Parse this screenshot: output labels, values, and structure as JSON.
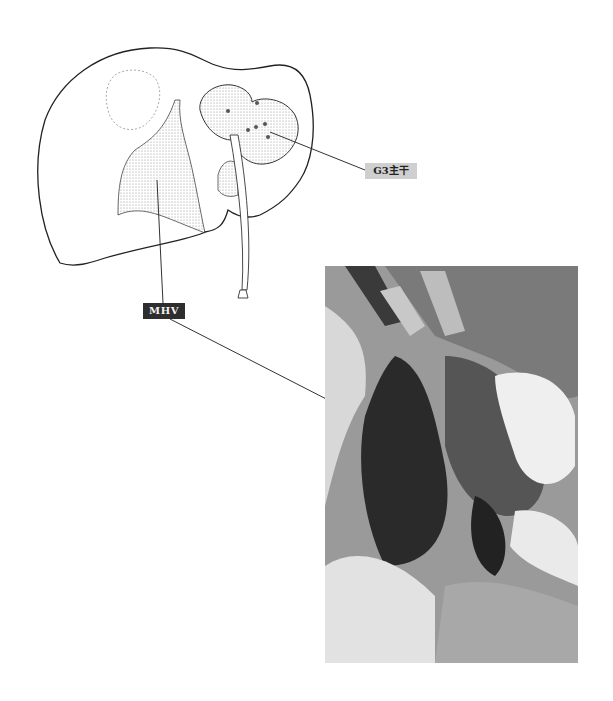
{
  "figure": {
    "labels": {
      "g3": "G3主干",
      "mhv": "MHV"
    },
    "colors": {
      "g3_label_bg": "#cfcfcf",
      "mhv_label_bg": "#2e2e2e",
      "line": "#333333"
    }
  }
}
